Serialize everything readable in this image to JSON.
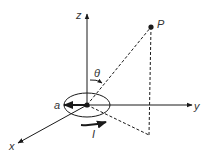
{
  "diagram": {
    "labels": {
      "z_axis": "z",
      "y_axis": "y",
      "x_axis": "x",
      "point": "P",
      "angle": "θ",
      "radius": "a",
      "current": "I"
    },
    "colors": {
      "line": "#1a1a1a",
      "text": "#333333",
      "background": "#ffffff"
    }
  }
}
